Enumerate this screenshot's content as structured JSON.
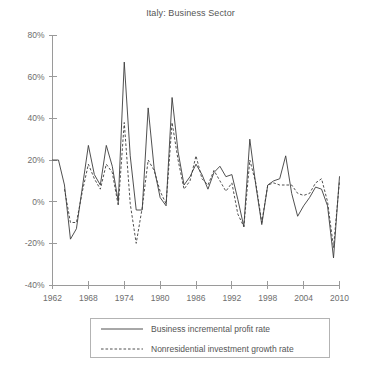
{
  "chart_data": {
    "type": "line",
    "title": "Italy: Business Sector",
    "xlabel": "",
    "ylabel": "",
    "xlim": [
      1962,
      2010
    ],
    "ylim": [
      -40,
      80
    ],
    "grid": false,
    "legend_position": "below-center",
    "x_ticks": [
      1962,
      1968,
      1974,
      1980,
      1986,
      1992,
      1998,
      2004,
      2010
    ],
    "x_tick_labels": [
      "1962",
      "1968",
      "1974",
      "1980",
      "1986",
      "1992",
      "1998",
      "2004",
      "2010"
    ],
    "y_ticks": [
      -40,
      -20,
      0,
      20,
      40,
      60,
      80
    ],
    "y_tick_labels": [
      "-40%",
      "-20%",
      "0%",
      "20%",
      "40%",
      "60%",
      "80%"
    ],
    "x": [
      1962,
      1963,
      1964,
      1965,
      1966,
      1967,
      1968,
      1969,
      1970,
      1971,
      1972,
      1973,
      1974,
      1975,
      1976,
      1977,
      1978,
      1979,
      1980,
      1981,
      1982,
      1983,
      1984,
      1985,
      1986,
      1987,
      1988,
      1989,
      1990,
      1991,
      1992,
      1993,
      1994,
      1995,
      1996,
      1997,
      1998,
      1999,
      2000,
      2001,
      2002,
      2003,
      2004,
      2005,
      2006,
      2007,
      2008,
      2009,
      2010
    ],
    "series": [
      {
        "name": "Business incremental profit rate",
        "style": "solid",
        "color": "#3c3c3c",
        "values": [
          20,
          20,
          8,
          -18,
          -13,
          7,
          27,
          13,
          8,
          27,
          17,
          0,
          67,
          22,
          -4,
          -4,
          45,
          16,
          2,
          -2,
          50,
          24,
          8,
          12,
          18,
          13,
          6,
          14,
          17,
          12,
          13,
          1,
          -12,
          30,
          8,
          -11,
          8,
          10,
          11,
          22,
          4,
          -7,
          -2,
          2,
          7,
          6,
          -2,
          -27,
          12
        ]
      },
      {
        "name": "Nonresidential investment growth rate",
        "style": "dashed",
        "color": "#3c3c3c",
        "values": [
          null,
          null,
          6,
          -10,
          -10,
          5,
          18,
          11,
          6,
          18,
          14,
          -2,
          38,
          -1,
          -20,
          -3,
          20,
          15,
          5,
          -1,
          38,
          20,
          6,
          10,
          22,
          11,
          8,
          15,
          10,
          5,
          9,
          -6,
          -12,
          20,
          9,
          -10,
          8,
          9,
          8,
          8,
          8,
          4,
          3,
          4,
          9,
          11,
          0,
          -22,
          10
        ]
      }
    ]
  },
  "legend": {
    "items": [
      {
        "label": "Business incremental profit rate",
        "style": "solid"
      },
      {
        "label": "Nonresidential investment growth rate",
        "style": "dashed"
      }
    ]
  }
}
